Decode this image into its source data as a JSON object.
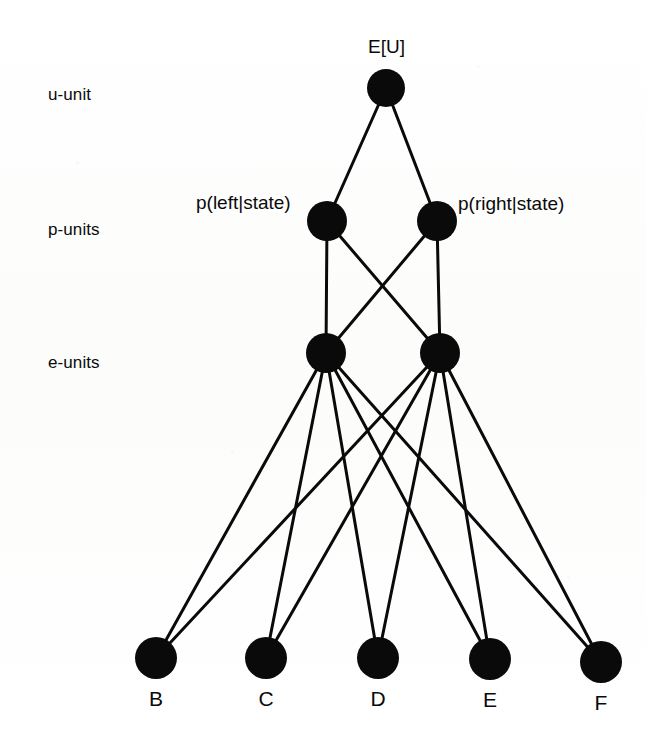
{
  "figure": {
    "type": "neural-network-diagram",
    "background_color": "#fdfdfc",
    "ink_color": "#0a0a0a",
    "width": 646,
    "height": 740
  },
  "row_labels": [
    {
      "id": "u-unit",
      "text": "u-unit",
      "x": 48,
      "y": 86
    },
    {
      "id": "p-units",
      "text": "p-units",
      "x": 48,
      "y": 221
    },
    {
      "id": "e-units",
      "text": "e-units",
      "x": 48,
      "y": 354
    }
  ],
  "node_labels": [
    {
      "id": "eu",
      "text": "E[U]",
      "x": 368,
      "y": 37,
      "align": "left"
    },
    {
      "id": "pleft",
      "text": "p(left|state)",
      "x": 196,
      "y": 193,
      "align": "left"
    },
    {
      "id": "pright",
      "text": "p(right|state)",
      "x": 458,
      "y": 194,
      "align": "left"
    }
  ],
  "nodes": [
    {
      "id": "u",
      "layer": "u-unit",
      "cx": 386,
      "cy": 88,
      "r": 19
    },
    {
      "id": "p1",
      "layer": "p-units",
      "cx": 327,
      "cy": 221,
      "r": 20
    },
    {
      "id": "p2",
      "layer": "p-units",
      "cx": 437,
      "cy": 221,
      "r": 20
    },
    {
      "id": "e1",
      "layer": "e-units",
      "cx": 326,
      "cy": 353,
      "r": 20
    },
    {
      "id": "e2",
      "layer": "e-units",
      "cx": 440,
      "cy": 353,
      "r": 20
    },
    {
      "id": "B",
      "layer": "leaf",
      "cx": 156,
      "cy": 658,
      "r": 21,
      "label": "B"
    },
    {
      "id": "C",
      "layer": "leaf",
      "cx": 266,
      "cy": 658,
      "r": 21,
      "label": "C"
    },
    {
      "id": "D",
      "layer": "leaf",
      "cx": 378,
      "cy": 658,
      "r": 21,
      "label": "D"
    },
    {
      "id": "E",
      "layer": "leaf",
      "cx": 490,
      "cy": 659,
      "r": 21,
      "label": "E"
    },
    {
      "id": "F",
      "layer": "leaf",
      "cx": 601,
      "cy": 662,
      "r": 21,
      "label": "F"
    }
  ],
  "leaf_labels": [
    {
      "id": "B",
      "text": "B",
      "x": 156,
      "y": 688
    },
    {
      "id": "C",
      "text": "C",
      "x": 266,
      "y": 688
    },
    {
      "id": "D",
      "text": "D",
      "x": 378,
      "y": 688
    },
    {
      "id": "E",
      "text": "E",
      "x": 490,
      "y": 689
    },
    {
      "id": "F",
      "text": "F",
      "x": 601,
      "y": 692
    }
  ],
  "edges": [
    {
      "from": "u",
      "to": "p1"
    },
    {
      "from": "u",
      "to": "p2"
    },
    {
      "from": "p1",
      "to": "e1"
    },
    {
      "from": "p1",
      "to": "e2"
    },
    {
      "from": "p2",
      "to": "e1"
    },
    {
      "from": "p2",
      "to": "e2"
    },
    {
      "from": "e1",
      "to": "B"
    },
    {
      "from": "e1",
      "to": "C"
    },
    {
      "from": "e1",
      "to": "D"
    },
    {
      "from": "e1",
      "to": "E"
    },
    {
      "from": "e1",
      "to": "F"
    },
    {
      "from": "e2",
      "to": "B"
    },
    {
      "from": "e2",
      "to": "C"
    },
    {
      "from": "e2",
      "to": "D"
    },
    {
      "from": "e2",
      "to": "E"
    },
    {
      "from": "e2",
      "to": "F"
    }
  ],
  "edge_style": {
    "width": 3,
    "color": "#0a0a0a"
  }
}
